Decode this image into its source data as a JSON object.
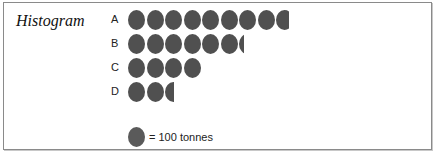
{
  "chart_data": {
    "type": "pictogram",
    "title": "Histogram",
    "categories": [
      "A",
      "B",
      "C",
      "D"
    ],
    "values": [
      875,
      630,
      400,
      250
    ],
    "unit": "tonnes",
    "icon_value": 100,
    "icon_counts": [
      8.75,
      6.3,
      4,
      2.5
    ],
    "legend": "= 100 tonnes",
    "icon_color": "#505050"
  },
  "title": "Histogram",
  "rows": [
    {
      "label": "A",
      "icons": 8.75
    },
    {
      "label": "B",
      "icons": 6.3
    },
    {
      "label": "C",
      "icons": 4
    },
    {
      "label": "D",
      "icons": 2.5
    }
  ],
  "legend": {
    "text": "= 100 tonnes"
  }
}
